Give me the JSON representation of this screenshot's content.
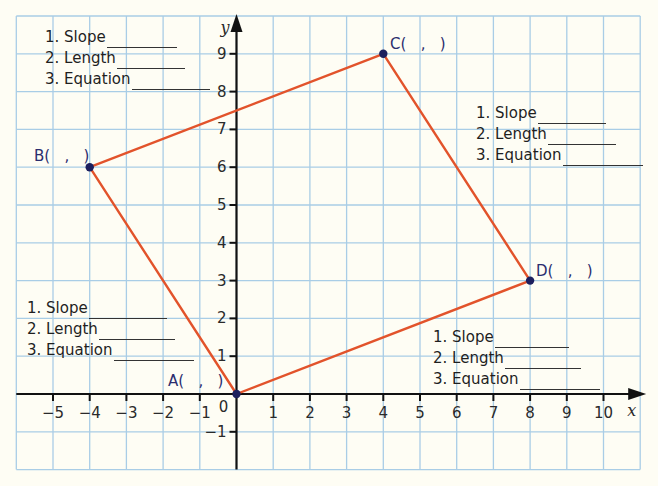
{
  "chart_data": {
    "type": "scatter",
    "title": "",
    "xlabel": "x",
    "ylabel": "y",
    "xlim": [
      -6,
      11
    ],
    "ylim": [
      -2,
      10
    ],
    "grid": true,
    "x_ticks": [
      "-5",
      "-4",
      "-3",
      "-2",
      "-1",
      "0",
      "1",
      "2",
      "3",
      "4",
      "5",
      "6",
      "7",
      "8",
      "9",
      "10"
    ],
    "y_ticks": [
      "-1",
      "1",
      "2",
      "3",
      "4",
      "5",
      "6",
      "7",
      "8",
      "9"
    ],
    "points": [
      {
        "name": "A",
        "x": 0,
        "y": 0,
        "label": "A(   ,   )"
      },
      {
        "name": "B",
        "x": -4,
        "y": 6,
        "label": "B(   ,   )"
      },
      {
        "name": "C",
        "x": 4,
        "y": 9,
        "label": "C(   ,   )"
      },
      {
        "name": "D",
        "x": 8,
        "y": 3,
        "label": "D(   ,   )"
      }
    ],
    "polygon": [
      "A",
      "B",
      "C",
      "D"
    ],
    "annotations": [
      {
        "side": "BC",
        "lines": [
          "1. Slope",
          "2. Length",
          "3. Equation"
        ]
      },
      {
        "side": "CD",
        "lines": [
          "1. Slope",
          "2. Length",
          "3. Equation"
        ]
      },
      {
        "side": "AB",
        "lines": [
          "1. Slope",
          "2. Length",
          "3. Equation"
        ]
      },
      {
        "side": "AD",
        "lines": [
          "1. Slope",
          "2. Length",
          "3. Equation"
        ]
      }
    ]
  },
  "colors": {
    "background": "#fefdf4",
    "grid": "#a9cde6",
    "axis": "#111111",
    "segment": "#e2532b",
    "point": "#1c1f5e",
    "point_label": "#2b2d6e"
  },
  "labels": {
    "A": "A(   ,   )",
    "B": "B(   ,   )",
    "C": "C(   ,   )",
    "D": "D(   ,   )",
    "origin": "0",
    "x_axis": "x",
    "y_axis": "y"
  },
  "question_blocks": {
    "top_left": {
      "slope": "1. Slope",
      "length": "2. Length",
      "equation": "3. Equation"
    },
    "top_right": {
      "slope": "1. Slope",
      "length": "2. Length",
      "equation": "3. Equation"
    },
    "bottom_left": {
      "slope": "1. Slope",
      "length": "2. Length",
      "equation": "3. Equation"
    },
    "bottom_right": {
      "slope": "1. Slope",
      "length": "2. Length",
      "equation": "3. Equation"
    }
  }
}
